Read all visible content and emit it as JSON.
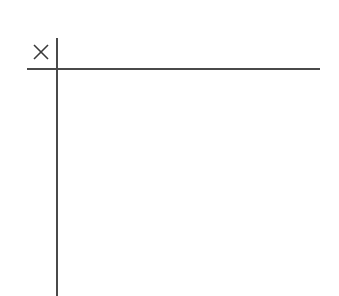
{
  "grid": {
    "corner_mark": "close-icon",
    "line_color": "#4a4a4a",
    "background": "#ffffff"
  }
}
